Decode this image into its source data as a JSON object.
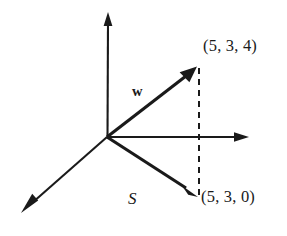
{
  "figure": {
    "kind": "3d-vector-diagram",
    "background_color": "#ffffff",
    "stroke_color": "#1a1a1a",
    "labels": {
      "point_w": "(5, 3, 4)",
      "point_projection": "(5, 3, 0)",
      "vector_w": "w",
      "vector_s": "S"
    },
    "geometry": {
      "origin": {
        "x": 107,
        "y": 137
      },
      "axis_vertical_tip": {
        "x": 108,
        "y": 13
      },
      "axis_horizontal_tip": {
        "x": 248,
        "y": 137
      },
      "axis_diagonal_tip": {
        "x": 22,
        "y": 212
      },
      "vector_w_tip": {
        "x": 196,
        "y": 68
      },
      "vector_s_tip": {
        "x": 197,
        "y": 196
      },
      "dashed_line_x": 199,
      "dashed_line_top_y": 68,
      "dashed_line_bottom_y": 196
    }
  }
}
